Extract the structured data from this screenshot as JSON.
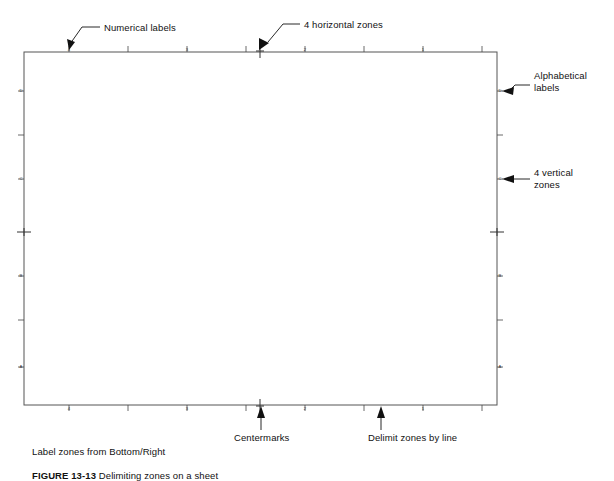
{
  "figure": {
    "caption_prefix": "FIGURE 13-13",
    "caption_text": "Delimiting zones on a sheet",
    "border": {
      "x": 24,
      "y": 52,
      "width": 473,
      "height": 353,
      "stroke_color": "#555555"
    }
  },
  "zones": {
    "horizontal_count": 4,
    "vertical_count": 4,
    "numerical_labels": [
      "4",
      "3",
      "2",
      "1"
    ],
    "alphabetical_labels": [
      "D",
      "C",
      "B",
      "A"
    ],
    "numerical_label_x": [
      69,
      187,
      305,
      423
    ],
    "alphabetical_label_y": [
      91,
      179,
      276,
      367
    ],
    "division_tick_x": [
      69,
      128,
      187,
      246,
      305,
      364,
      423,
      482
    ],
    "division_tick_y": [
      91,
      135,
      179,
      232,
      276,
      320,
      367
    ],
    "centermark_top_x": 260,
    "centermark_bottom_x": 260,
    "centermark_left_y": 232,
    "centermark_right_y": 232
  },
  "annotations": {
    "numerical_labels": "Numerical labels",
    "horizontal_zones": "4 horizontal zones",
    "alphabetical_labels": "Alphabetical\nlabels",
    "vertical_zones": "4 vertical\nzones",
    "centermarks": "Centermarks",
    "delimit": "Delimit zones by line",
    "label_zones": "Label zones from Bottom/Right"
  },
  "colors": {
    "ink": "#111111",
    "line": "#555555",
    "tick": "#444444"
  }
}
